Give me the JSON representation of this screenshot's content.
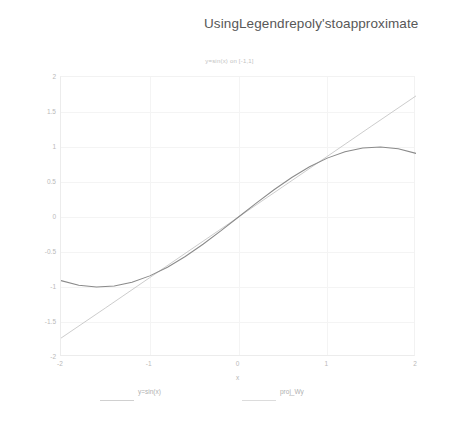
{
  "heading": "UsingLegendrepoly'stoapproximate",
  "figure": {
    "title": "y=sin(x) on [-1,1]",
    "xlabel": "x",
    "legend": [
      {
        "label": "y=sin(x)",
        "color": "#d0d0d0"
      },
      {
        "label": "proj_Wy",
        "color": "#dcdcdc"
      }
    ]
  },
  "chart_data": {
    "type": "line",
    "title": "y=sin(x) on [-1,1]",
    "xlabel": "x",
    "ylabel": "",
    "xlim": [
      -2,
      2
    ],
    "ylim": [
      -2,
      2
    ],
    "xticks": [
      -2,
      -1,
      0,
      1,
      2
    ],
    "yticks": [
      2,
      1.5,
      1,
      0.5,
      0,
      -0.5,
      -1,
      -1.5,
      -2
    ],
    "xtick_labels": [
      "-2",
      "-1",
      "0",
      "1",
      "2"
    ],
    "ytick_labels": [
      "2",
      "1.5",
      "1",
      "0.5",
      "0",
      "-0.5",
      "-1",
      "-1.5",
      "-2"
    ],
    "grid": true,
    "legend_position": "below-axes",
    "series": [
      {
        "name": "y=sin(x)",
        "color": "#8a8a8a",
        "x": [
          -2,
          -1.8,
          -1.6,
          -1.4,
          -1.2,
          -1,
          -0.8,
          -0.6,
          -0.4,
          -0.2,
          0,
          0.2,
          0.4,
          0.6,
          0.8,
          1,
          1.2,
          1.4,
          1.6,
          1.8,
          2
        ],
        "y": [
          -0.909,
          -0.974,
          -1.0,
          -0.985,
          -0.932,
          -0.841,
          -0.717,
          -0.565,
          -0.389,
          -0.199,
          0,
          0.199,
          0.389,
          0.565,
          0.717,
          0.841,
          0.932,
          0.985,
          1.0,
          0.974,
          0.909
        ]
      },
      {
        "name": "proj_Wy",
        "color": "#c6c6c6",
        "x": [
          -2,
          -1.5,
          -1,
          -0.5,
          0,
          0.5,
          1,
          1.5,
          2
        ],
        "y": [
          -1.73,
          -1.3,
          -0.866,
          -0.433,
          0,
          0.433,
          0.866,
          1.3,
          1.73
        ]
      }
    ]
  }
}
